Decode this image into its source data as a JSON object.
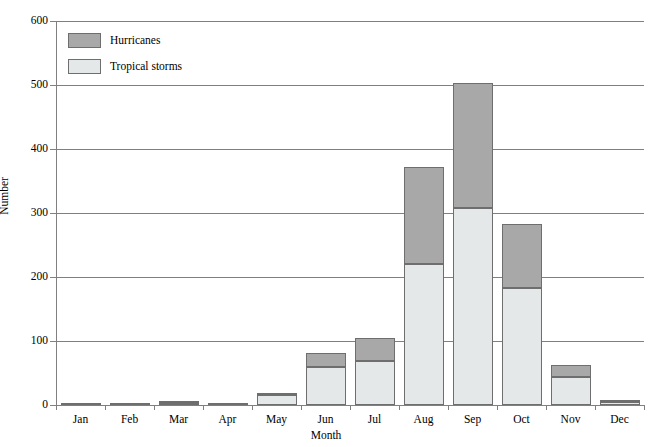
{
  "chart_data": {
    "type": "bar",
    "stacked": true,
    "title": "",
    "xlabel": "Month",
    "ylabel": "Number",
    "ylim": [
      0,
      600
    ],
    "ytick_step": 100,
    "yticks": [
      "0",
      "100",
      "200",
      "300",
      "400",
      "500",
      "600"
    ],
    "grid": true,
    "legend_position": "top-left",
    "categories": [
      "Jan",
      "Feb",
      "Mar",
      "Apr",
      "May",
      "Jun",
      "Jul",
      "Aug",
      "Sep",
      "Oct",
      "Nov",
      "Dec"
    ],
    "series": [
      {
        "name": "Tropical storms",
        "color": "#e4e8e8",
        "values": [
          1,
          1,
          2,
          1,
          16,
          59,
          69,
          220,
          308,
          183,
          43,
          4
        ]
      },
      {
        "name": "Hurricanes",
        "color": "#a8a8a8",
        "values": [
          0,
          0,
          1,
          0,
          2,
          23,
          35,
          152,
          195,
          100,
          19,
          4
        ]
      }
    ],
    "totals": [
      1,
      1,
      3,
      1,
      18,
      82,
      104,
      372,
      503,
      283,
      62,
      8
    ]
  },
  "legend": {
    "items": [
      {
        "label": "Hurricanes",
        "color": "#a8a8a8"
      },
      {
        "label": "Tropical storms",
        "color": "#e4e8e8"
      }
    ]
  },
  "axes": {
    "y_title": "Number",
    "x_title": "Month"
  },
  "colors": {
    "hurricanes": "#a8a8a8",
    "tropical_storms": "#e4e8e8",
    "grid": "#808080",
    "bar_border": "#6e6e6e",
    "background": "#ffffff"
  }
}
